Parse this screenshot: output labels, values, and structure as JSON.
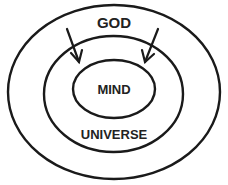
{
  "diagram": {
    "type": "nested-ellipses",
    "labels": {
      "outer": "GOD",
      "inner": "MIND",
      "middle": "UNIVERSE"
    },
    "rings": [
      {
        "name": "outer",
        "label": "GOD",
        "cx": 114,
        "cy": 92,
        "rx": 106,
        "ry": 87
      },
      {
        "name": "middle",
        "label": "UNIVERSE",
        "cx": 113.5,
        "cy": 94,
        "rx": 69.5,
        "ry": 58
      },
      {
        "name": "inner",
        "label": "MIND",
        "cx": 114,
        "cy": 89,
        "rx": 41,
        "ry": 29
      }
    ],
    "arrows": [
      {
        "name": "left-arrow",
        "from": [
          67,
          29
        ],
        "to": [
          79,
          62
        ],
        "direction": "down-right"
      },
      {
        "name": "right-arrow",
        "from": [
          158,
          29
        ],
        "to": [
          145,
          62
        ],
        "direction": "down-left"
      }
    ],
    "colors": {
      "stroke": "#1a1a1a",
      "text": "#222222",
      "background": "#ffffff"
    }
  }
}
